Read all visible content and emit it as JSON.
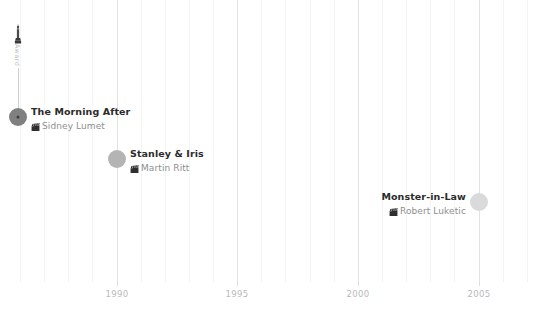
{
  "chart_data": {
    "type": "scatter",
    "title": "",
    "xlabel": "",
    "ylabel": "",
    "xlim": [
      1985.2,
      2008.5
    ],
    "grid": true,
    "legend": false,
    "x_ticks": [
      "1990",
      "1995",
      "2000",
      "2005"
    ],
    "x_tick_values": [
      1990,
      1995,
      2000,
      2005
    ],
    "points": [
      {
        "title": "The Morning After",
        "director": "Sidney Lumet",
        "year": 1986,
        "x": 18,
        "y": 117,
        "radius": 9,
        "color": "#808080",
        "has_center_dot": true,
        "label_side": "right",
        "icon": "clapperboard-icon"
      },
      {
        "title": "Stanley & Iris",
        "director": "Martin Ritt",
        "year": 1990,
        "x": 117,
        "y": 159,
        "radius": 9,
        "color": "#b4b4b4",
        "has_center_dot": false,
        "label_side": "right",
        "icon": "clapperboard-icon"
      },
      {
        "title": "Monster-in-Law",
        "director": "Robert Luketic",
        "year": 2005,
        "x": 479,
        "y": 202,
        "radius": 9,
        "color": "#dadada",
        "has_center_dot": false,
        "label_side": "left",
        "icon": "clapperboard-icon"
      }
    ],
    "annotations": [
      {
        "name": "award-marker",
        "icon": "award-statuette-icon",
        "label": "Award",
        "x": 18,
        "y": 26,
        "stem_from_y": 45,
        "stem_to_y": 117
      }
    ],
    "gridlines_major": [
      1990,
      1995,
      2000,
      2005
    ],
    "gridlines_minor": [
      1986,
      1987,
      1988,
      1989,
      1991,
      1992,
      1993,
      1994,
      1996,
      1997,
      1998,
      1999,
      2001,
      2002,
      2003,
      2004,
      2006,
      2007,
      2008
    ],
    "colors": {
      "background": "#ffffff",
      "gridline_major": "#e3e3e3",
      "gridline_minor": "#f4f4f4",
      "axis_text": "#b9b9b9",
      "title_text": "#2b2b2b",
      "director_text": "#8e8e8e",
      "stem": "#cfcfcf"
    }
  }
}
